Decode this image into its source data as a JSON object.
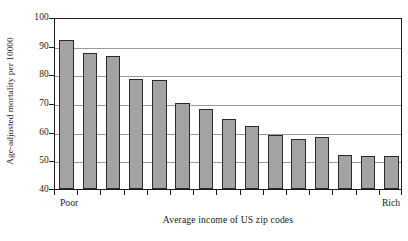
{
  "chart_data": {
    "type": "bar",
    "title": "",
    "xlabel": "Average income of US zip codes",
    "ylabel": "Age-adjusted mortality per 10000",
    "ylim": [
      40,
      100
    ],
    "yticks": [
      40,
      50,
      60,
      70,
      80,
      90,
      100
    ],
    "ytick_labels": [
      "40",
      "50",
      "60",
      "70",
      "80",
      "90",
      "100"
    ],
    "grid": true,
    "legend": null,
    "x_axis_endpoint_labels": {
      "left": "Poor",
      "right": "Rich"
    },
    "categories": [
      "1",
      "2",
      "3",
      "4",
      "5",
      "6",
      "7",
      "8",
      "9",
      "10",
      "11",
      "12",
      "13",
      "14",
      "15"
    ],
    "values": [
      92,
      87.5,
      86.5,
      78.5,
      78,
      70,
      68,
      64.5,
      62,
      59,
      57.5,
      58,
      52,
      51.5,
      51.5
    ],
    "bar_color": "#a3a3a3",
    "bar_edge_color": "#2b2b2b",
    "gridline_color": "#9a9a9a",
    "axis_color": "#1c1c1c"
  }
}
